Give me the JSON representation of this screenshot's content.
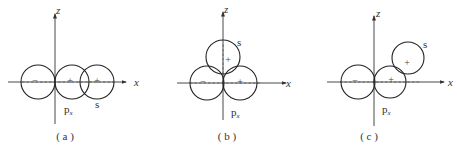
{
  "figure": {
    "panels": [
      {
        "id": "a",
        "caption": "( a )",
        "axis_x_label": "x",
        "axis_z_label": "z",
        "orbital_label_main": "p",
        "orbital_label_sub": "x",
        "s_label": "s",
        "signs": {
          "p_left": "−",
          "p_right": "+",
          "s": "+"
        },
        "description": "s orbital overlaps positive lobe of px along x-axis"
      },
      {
        "id": "b",
        "caption": "( b )",
        "axis_x_label": "x",
        "axis_z_label": "z",
        "orbital_label_main": "p",
        "orbital_label_sub": "x",
        "s_label": "s",
        "signs": {
          "p_left": "−",
          "p_right": "+",
          "s": "+"
        },
        "description": "s orbital on z-axis overlaps both lobes of px equally"
      },
      {
        "id": "c",
        "caption": "( c )",
        "axis_x_label": "x",
        "axis_z_label": "z",
        "orbital_label_main": "p",
        "orbital_label_sub": "x",
        "s_label": "s",
        "signs": {
          "p_left": "−",
          "p_right": "+",
          "s": "+"
        },
        "description": "s orbital off-axis partially overlaps positive lobe of px"
      }
    ]
  }
}
